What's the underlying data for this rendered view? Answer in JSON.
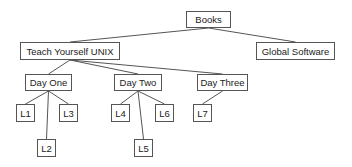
{
  "diagram": {
    "type": "tree",
    "line_color": "#555555",
    "nodes": {
      "books": {
        "label": "Books",
        "x": 186,
        "y": 11,
        "w": 45,
        "h": 17
      },
      "unix": {
        "label": "Teach Yourself UNIX",
        "x": 20,
        "y": 42,
        "w": 100,
        "h": 18
      },
      "global": {
        "label": "Global Software",
        "x": 256,
        "y": 42,
        "w": 79,
        "h": 18
      },
      "day1": {
        "label": "Day One",
        "x": 25,
        "y": 74,
        "w": 47,
        "h": 17
      },
      "day2": {
        "label": "Day Two",
        "x": 114,
        "y": 74,
        "w": 48,
        "h": 17
      },
      "day3": {
        "label": "Day Three",
        "x": 197,
        "y": 74,
        "w": 51,
        "h": 17
      },
      "l1": {
        "label": "L1",
        "x": 16,
        "y": 104,
        "w": 19,
        "h": 18
      },
      "l2": {
        "label": "L2",
        "x": 37,
        "y": 139,
        "w": 19,
        "h": 18
      },
      "l3": {
        "label": "L3",
        "x": 59,
        "y": 104,
        "w": 19,
        "h": 18
      },
      "l4": {
        "label": "L4",
        "x": 111,
        "y": 104,
        "w": 19,
        "h": 18
      },
      "l5": {
        "label": "L5",
        "x": 134,
        "y": 139,
        "w": 19,
        "h": 18
      },
      "l6": {
        "label": "L6",
        "x": 155,
        "y": 104,
        "w": 19,
        "h": 18
      },
      "l7": {
        "label": "L7",
        "x": 193,
        "y": 104,
        "w": 19,
        "h": 18
      }
    },
    "edges": [
      [
        "books",
        "unix"
      ],
      [
        "books",
        "global"
      ],
      [
        "unix",
        "day1"
      ],
      [
        "unix",
        "day2"
      ],
      [
        "unix",
        "day3"
      ],
      [
        "day1",
        "l1"
      ],
      [
        "day1",
        "l2"
      ],
      [
        "day1",
        "l3"
      ],
      [
        "day2",
        "l4"
      ],
      [
        "day2",
        "l5"
      ],
      [
        "day2",
        "l6"
      ],
      [
        "day3",
        "l7"
      ]
    ]
  }
}
